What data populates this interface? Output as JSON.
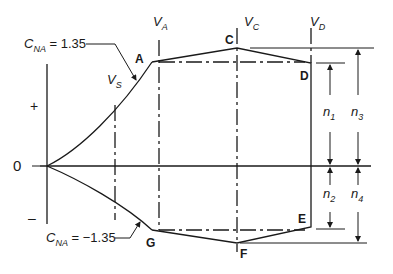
{
  "diagram": {
    "axis": {
      "plus_label": "+",
      "zero_label": "0",
      "minus_label": "–"
    },
    "speed_labels": {
      "vs": {
        "main": "V",
        "sub": "S"
      },
      "va": {
        "main": "V",
        "sub": "A"
      },
      "vc": {
        "main": "V",
        "sub": "C"
      },
      "vd": {
        "main": "V",
        "sub": "D"
      }
    },
    "points": {
      "A": "A",
      "C": "C",
      "D": "D",
      "E": "E",
      "F": "F",
      "G": "G"
    },
    "annotations": {
      "cna_pos": {
        "main": "C",
        "sub": "NA",
        "value": " = 1.35"
      },
      "cna_neg": {
        "main": "C",
        "sub": "NA",
        "value": " = −1.35"
      }
    },
    "dimensions": {
      "n1": {
        "main": "n",
        "sub": "1"
      },
      "n2": {
        "main": "n",
        "sub": "2"
      },
      "n3": {
        "main": "n",
        "sub": "3"
      },
      "n4": {
        "main": "n",
        "sub": "4"
      }
    }
  }
}
